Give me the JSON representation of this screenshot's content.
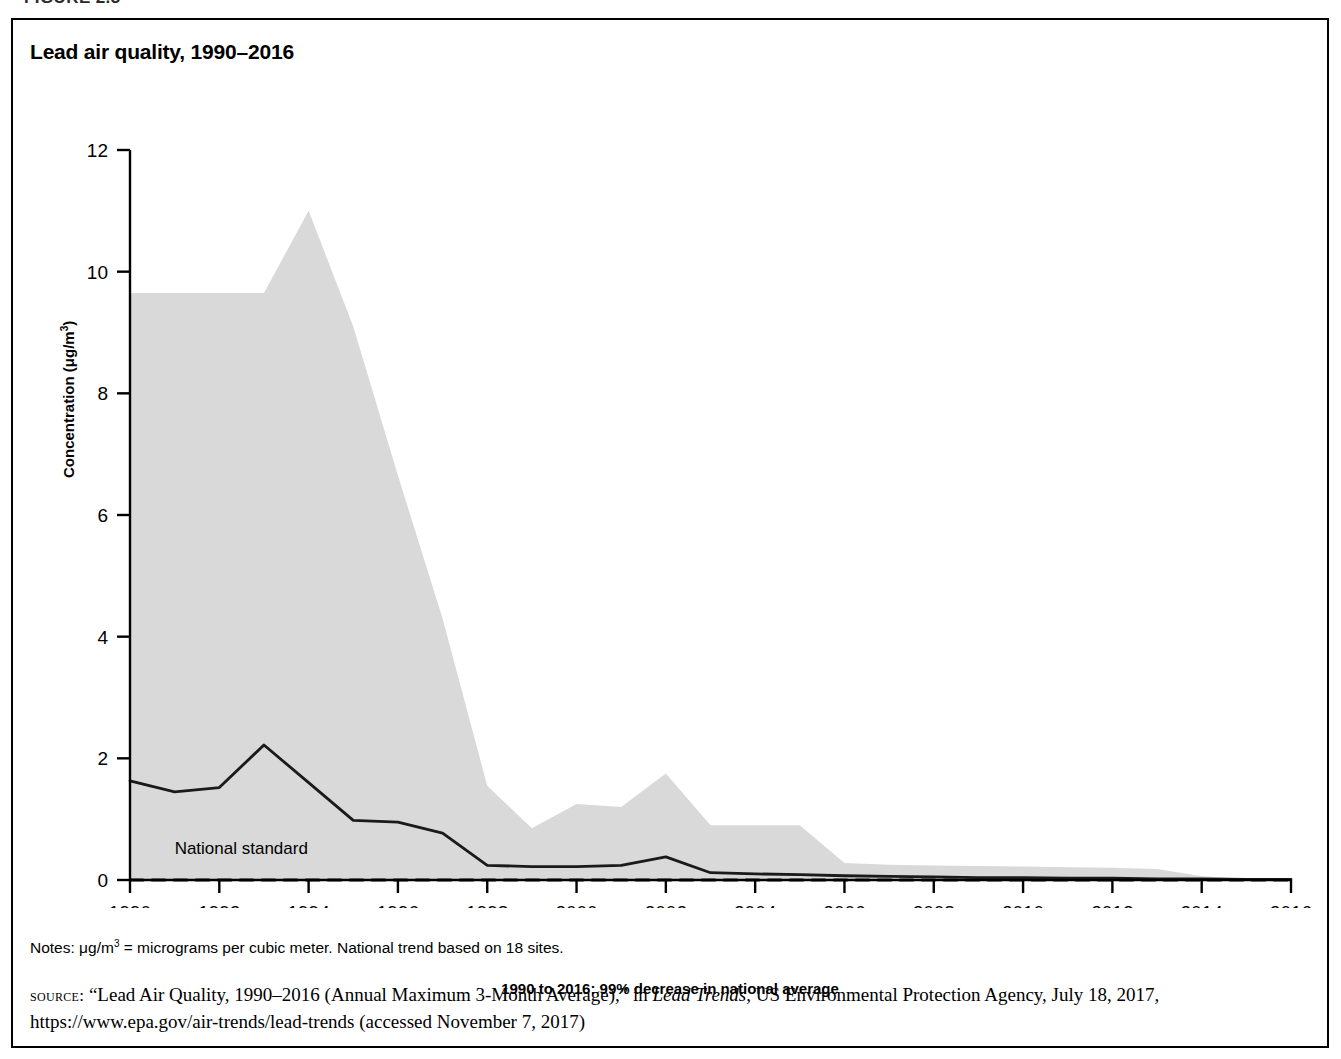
{
  "figure": {
    "heading": "FIGURE 2.3",
    "title": "Lead air quality, 1990–2016"
  },
  "axis": {
    "y_label_text": "Concentration (μg/m",
    "y_label_exp": "3",
    "y_label_close": ")",
    "x_caption": "1990 to 2016: 99% decrease in national average"
  },
  "annotations": {
    "national_standard": "National standard"
  },
  "notes": {
    "prefix": "Notes: μg/m",
    "exp": "3",
    "rest": " = micrograms per cubic meter. National trend based on 18 sites."
  },
  "source": {
    "label": "source:",
    "text_part1": " “Lead Air Quality, 1990–2016 (Annual Maximum 3-Month Average),” in ",
    "italic": "Lead Trends",
    "text_part2": ", US Environmental Protection Agency, July 18, 2017, https://www.epa.gov/air-trends/lead-trends (accessed November 7, 2017)"
  },
  "colors": {
    "band_fill": "#d9d9d9",
    "trend_line": "#1a1a1a",
    "standard_line": "#1a1a1a",
    "axis": "#000000",
    "frame": "#000000"
  },
  "chart_data": {
    "type": "area",
    "title": "Lead air quality, 1990–2016",
    "xlabel": "1990 to 2016: 99% decrease in national average",
    "ylabel": "Concentration (μg/m3)",
    "xlim": [
      1990,
      2016
    ],
    "ylim": [
      0,
      12
    ],
    "yticks": [
      0,
      2,
      4,
      6,
      8,
      10,
      12
    ],
    "xticks": [
      1990,
      1992,
      1994,
      1996,
      1998,
      2000,
      2002,
      2004,
      2006,
      2008,
      2010,
      2012,
      2014,
      2016
    ],
    "grid": false,
    "legend": "none",
    "x": [
      1990,
      1991,
      1992,
      1993,
      1994,
      1995,
      1996,
      1997,
      1998,
      1999,
      2000,
      2001,
      2002,
      2003,
      2004,
      2005,
      2006,
      2007,
      2008,
      2009,
      2010,
      2011,
      2012,
      2013,
      2014,
      2015,
      2016
    ],
    "series": [
      {
        "name": "90th percentile (band upper bound)",
        "values": [
          9.65,
          9.65,
          9.65,
          9.65,
          11.0,
          9.1,
          6.65,
          4.3,
          1.55,
          0.85,
          1.25,
          1.2,
          1.75,
          0.9,
          0.9,
          0.9,
          0.28,
          0.25,
          0.24,
          0.23,
          0.22,
          0.21,
          0.2,
          0.18,
          0.06,
          0.02,
          0.0
        ]
      },
      {
        "name": "10th percentile (band lower bound)",
        "values": [
          0.0,
          0.0,
          0.0,
          0.0,
          0.0,
          0.0,
          0.0,
          0.0,
          0.0,
          0.0,
          0.0,
          0.0,
          0.0,
          0.0,
          0.0,
          0.0,
          0.0,
          0.0,
          0.0,
          0.0,
          0.0,
          0.0,
          0.0,
          0.0,
          0.0,
          0.0,
          0.0
        ]
      },
      {
        "name": "National average (trend line)",
        "values": [
          1.63,
          1.45,
          1.52,
          2.22,
          1.6,
          0.98,
          0.95,
          0.77,
          0.24,
          0.22,
          0.22,
          0.24,
          0.38,
          0.12,
          0.1,
          0.09,
          0.07,
          0.06,
          0.05,
          0.04,
          0.04,
          0.03,
          0.03,
          0.02,
          0.02,
          0.01,
          0.01
        ]
      },
      {
        "name": "National standard",
        "values": [
          0.0,
          0.0,
          0.0,
          0.0,
          0.0,
          0.0,
          0.0,
          0.0,
          0.0,
          0.0,
          0.0,
          0.0,
          0.0,
          0.0,
          0.0,
          0.0,
          0.0,
          0.0,
          0.0,
          0.0,
          0.0,
          0.0,
          0.0,
          0.0,
          0.0,
          0.0,
          0.0
        ],
        "style": "dashed"
      }
    ],
    "annotations": [
      {
        "text": "National standard",
        "x": 1991.0,
        "y": 0.42
      }
    ]
  }
}
